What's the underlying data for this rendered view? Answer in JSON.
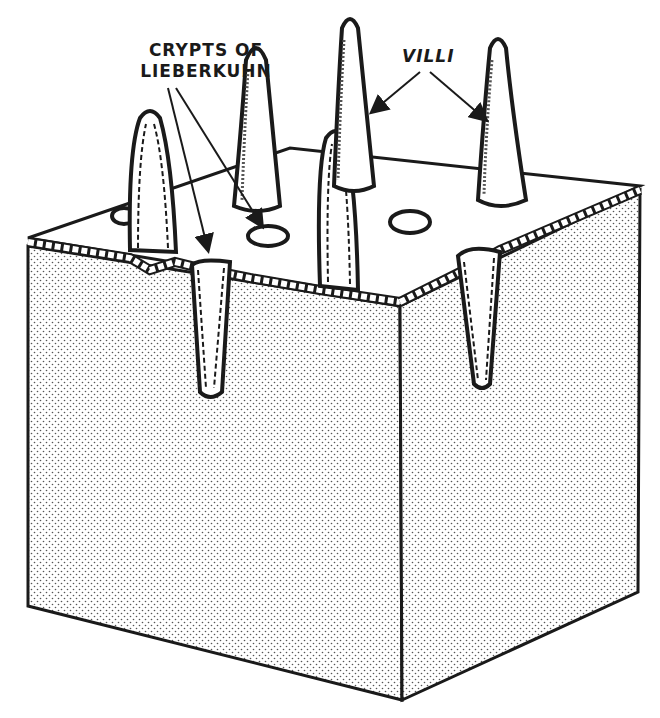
{
  "diagram": {
    "labels": {
      "crypts_line1": "CRYPTS OF",
      "crypts_line2": "LIEBERKUHN",
      "villi": "VILLI"
    },
    "colors": {
      "ink": "#1a1a1a",
      "background": "#ffffff",
      "stipple": "#555555"
    }
  }
}
